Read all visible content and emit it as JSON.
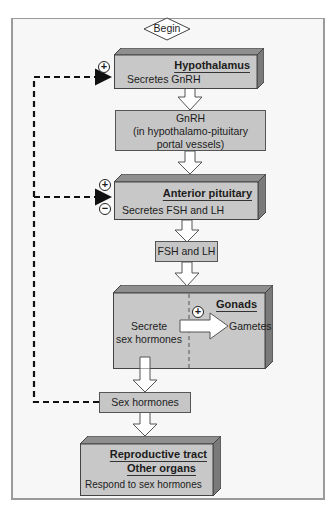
{
  "start": {
    "label": "Begin"
  },
  "hypothalamus": {
    "title": "Hypothalamus",
    "text": "Secretes GnRH",
    "feedback_sign": "+"
  },
  "gnrh": {
    "line1": "GnRH",
    "line2": "(in hypothalamo-pituitary",
    "line3": "portal vessels)"
  },
  "anterior_pituitary": {
    "title": "Anterior pituitary",
    "text": "Secretes FSH and LH",
    "feedback_sign_positive": "+",
    "feedback_sign_negative": "−"
  },
  "fsh_lh": {
    "label": "FSH and LH"
  },
  "gonads": {
    "title": "Gonads",
    "left_line1": "Secrete",
    "left_line2": "sex hormones",
    "right_label": "Gametes",
    "sign": "+"
  },
  "sex_hormones": {
    "label": "Sex hormones"
  },
  "targets": {
    "title1": "Reproductive tract",
    "title2": "Other organs",
    "text": "Respond to sex hormones"
  },
  "colors": {
    "box_face": "#c8c8c8",
    "box_top": "#8f8f8f",
    "box_side": "#7a7a7a",
    "background": "#f7f7f7"
  }
}
